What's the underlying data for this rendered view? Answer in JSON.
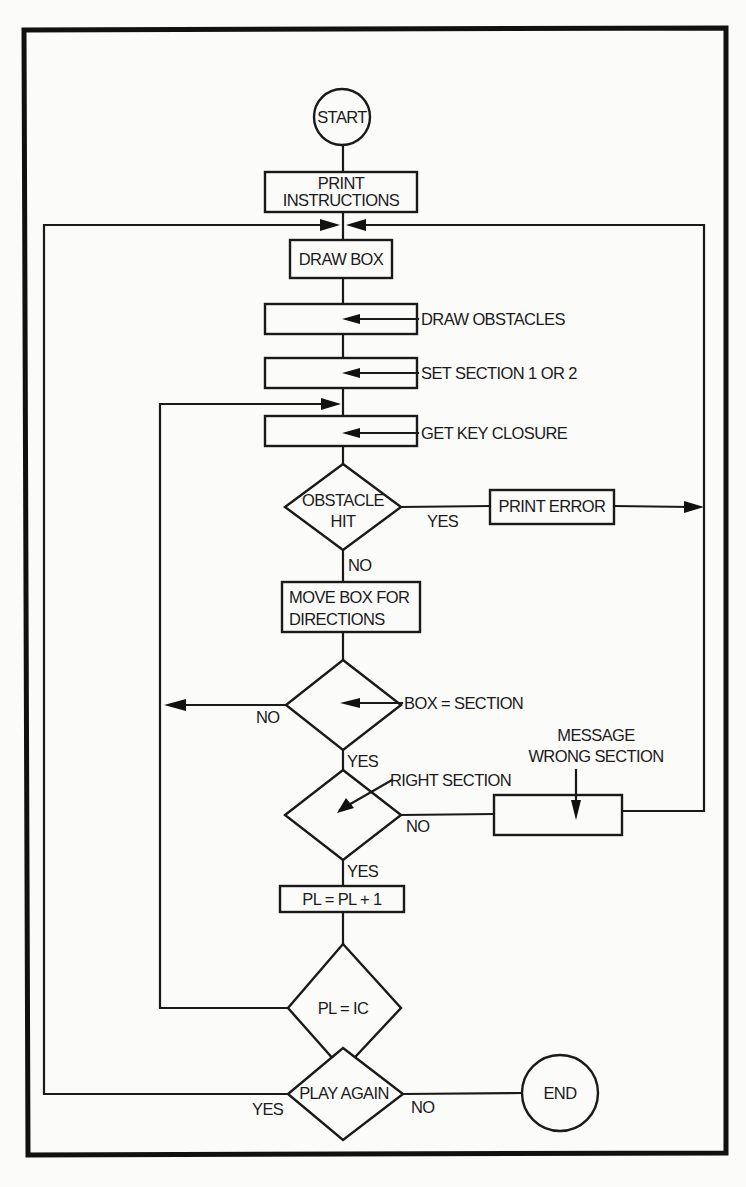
{
  "flowchart": {
    "start": "START",
    "end": "END",
    "print_instructions": [
      "PRINT",
      "INSTRUCTIONS"
    ],
    "draw_box": "DRAW BOX",
    "annotations": {
      "draw_obstacles": "DRAW OBSTACLES",
      "set_section": "SET SECTION 1 OR 2",
      "get_key_closure": "GET KEY CLOSURE",
      "box_equals_section": "BOX = SECTION",
      "right_section": "RIGHT SECTION",
      "message_wrong_section": [
        "MESSAGE",
        "WRONG SECTION"
      ]
    },
    "obstacle_hit": [
      "OBSTACLE",
      "HIT"
    ],
    "print_error": "PRINT ERROR",
    "move_box": [
      "MOVE BOX FOR",
      "DIRECTIONS"
    ],
    "pl_increment": "PL = PL + 1",
    "pl_equals_ic": "PL = IC",
    "play_again": "PLAY AGAIN",
    "branch_labels": {
      "obstacle_yes": "YES",
      "obstacle_no": "NO",
      "box_section_no": "NO",
      "box_section_yes": "YES",
      "right_section_no": "NO",
      "right_section_yes": "YES",
      "play_again_yes": "YES",
      "play_again_no": "NO"
    }
  }
}
